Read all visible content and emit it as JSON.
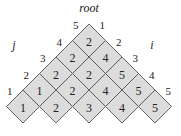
{
  "diagram": {
    "title": "root",
    "left_axis_label": "j",
    "right_axis_label": "i",
    "rows": [
      [
        2
      ],
      [
        2,
        4
      ],
      [
        2,
        2,
        5
      ],
      [
        1,
        2,
        4,
        5
      ],
      [
        1,
        2,
        3,
        4,
        5
      ]
    ],
    "left_edge_labels": [
      "5",
      "4",
      "3",
      "2",
      "1"
    ],
    "right_edge_labels": [
      "1",
      "2",
      "3",
      "4",
      "5"
    ],
    "colors": {
      "cell_fill": "#dcdcdc",
      "cell_stroke": "#555555"
    }
  }
}
